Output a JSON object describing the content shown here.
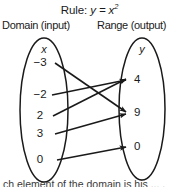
{
  "diagram": {
    "title_prefix": "Rule:",
    "title_equation": "y = x",
    "title_exponent": "2",
    "domain_heading": "Domain (input)",
    "range_heading": "Range (output)",
    "domain_variable": "x",
    "range_variable": "y",
    "domain_values": [
      "−3",
      "−2",
      "2",
      "3",
      "0"
    ],
    "range_values": [
      "4",
      "9",
      "0"
    ],
    "mappings": [
      {
        "from": "−3",
        "to": "9"
      },
      {
        "from": "−2",
        "to": "4"
      },
      {
        "from": "2",
        "to": "4"
      },
      {
        "from": "3",
        "to": "9"
      },
      {
        "from": "0",
        "to": "0"
      }
    ],
    "caption": "ch element of the domain is his ... .",
    "colors": {
      "stroke": "#1a1a1a",
      "text": "#1a1a1a",
      "background": "#ffffff"
    }
  }
}
